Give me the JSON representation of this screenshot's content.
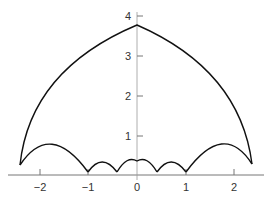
{
  "diagram": {
    "x_ticks": [
      {
        "v": -2,
        "label": "−2"
      },
      {
        "v": -1,
        "label": "−1"
      },
      {
        "v": 0,
        "label": "0"
      },
      {
        "v": 1,
        "label": "1"
      },
      {
        "v": 2,
        "label": "2"
      }
    ],
    "y_ticks": [
      {
        "v": 1,
        "label": "1"
      },
      {
        "v": 2,
        "label": "2"
      },
      {
        "v": 3,
        "label": "3"
      },
      {
        "v": 4,
        "label": "4"
      }
    ],
    "curve_color": "#111111",
    "axis_color": "#888888"
  }
}
